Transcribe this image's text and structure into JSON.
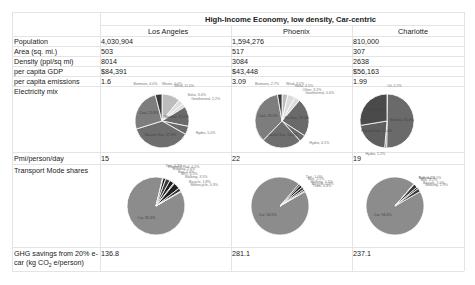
{
  "title": "High-Income Economy, low density, Car-centric",
  "cities": [
    "Los Angeles",
    "Phoenix",
    "Charlotte"
  ],
  "rows": [
    {
      "label": "Population",
      "values": [
        "4,030,904",
        "1,594,276",
        "810,000"
      ]
    },
    {
      "label": "Area (sq. mi.)",
      "values": [
        "503",
        "517",
        "307"
      ]
    },
    {
      "label": "Density (ppl/sq mi)",
      "values": [
        "8014",
        "3084",
        "2638"
      ]
    },
    {
      "label": "per capita GDP",
      "values": [
        "$84,391",
        "$43,448",
        "$56,163"
      ]
    },
    {
      "label": "per capita emissions",
      "values": [
        "1.6",
        "3.09",
        "1.99"
      ]
    }
  ],
  "electricity_label": "Electricity mix",
  "pmt_row": {
    "label": "Pmi/person/day",
    "values": [
      "15",
      "22",
      "19"
    ]
  },
  "transport_label": "Transport Mode shares",
  "ghg_row": {
    "label_line1": "GHG savings from 20% e-",
    "label_line2_pre": "car (kg CO",
    "label_line2_sub": "2",
    "label_line2_post": " e/person)",
    "values": [
      "136.8",
      "281.1",
      "237.1"
    ]
  },
  "chart_data": [
    {
      "type": "pie",
      "title": "Electricity mix - Los Angeles",
      "slices": [
        {
          "label": "Waste",
          "value": 0.0
        },
        {
          "label": "Wind",
          "value": 11.0
        },
        {
          "label": "Solar",
          "value": 3.0
        },
        {
          "label": "Geothermal",
          "value": 2.2
        },
        {
          "label": "Nuclear",
          "value": 12.0
        },
        {
          "label": "Hydro",
          "value": 5.0
        },
        {
          "label": "Natural Gas",
          "value": 37.0
        },
        {
          "label": "Coal",
          "value": 25.8
        },
        {
          "label": "Biomass",
          "value": 4.0
        }
      ]
    },
    {
      "type": "pie",
      "title": "Electricity mix - Phoenix",
      "slices": [
        {
          "label": "Wind",
          "value": 3.5
        },
        {
          "label": "Solar",
          "value": 4.5
        },
        {
          "label": "Other",
          "value": 3.2
        },
        {
          "label": "Geothermal",
          "value": 0.0
        },
        {
          "label": "Nuclear",
          "value": 23.0
        },
        {
          "label": "Hydro",
          "value": 4.1
        },
        {
          "label": "Natural Gas",
          "value": 24.0
        },
        {
          "label": "Coal",
          "value": 35.0
        },
        {
          "label": "Biomass",
          "value": 2.7
        }
      ]
    },
    {
      "type": "pie",
      "title": "Electricity mix - Charlotte",
      "slices": [
        {
          "label": "Oil",
          "value": 0.2
        },
        {
          "label": "Nuclear",
          "value": 50.0
        },
        {
          "label": "Hydro",
          "value": 1.2
        },
        {
          "label": "Natural Gas",
          "value": 21.0
        },
        {
          "label": "Coal",
          "value": 27.6
        }
      ]
    },
    {
      "type": "pie",
      "title": "Transport Mode shares - Los Angeles",
      "slices": [
        {
          "label": "Car",
          "value": 85.3
        },
        {
          "label": "Taxi",
          "value": 0.3
        },
        {
          "label": "Regional Rail",
          "value": 1.5
        },
        {
          "label": "Subway",
          "value": 2.4
        },
        {
          "label": "Bus",
          "value": 2.4
        },
        {
          "label": "BRT",
          "value": 0.5
        },
        {
          "label": "Walking",
          "value": 3.5
        },
        {
          "label": "Bicycle",
          "value": 1.8
        },
        {
          "label": "Motorcycle",
          "value": 0.3
        }
      ]
    },
    {
      "type": "pie",
      "title": "Transport Mode shares - Phoenix",
      "slices": [
        {
          "label": "Car",
          "value": 94.5
        },
        {
          "label": "Taxi",
          "value": 1.0
        },
        {
          "label": "Bus",
          "value": 1.5
        },
        {
          "label": "Walking",
          "value": 1.5
        },
        {
          "label": "Bicycle",
          "value": 0.9
        },
        {
          "label": "Tram",
          "value": 0.4
        }
      ]
    },
    {
      "type": "pie",
      "title": "Transport Mode shares - Charlotte",
      "slices": [
        {
          "label": "Car",
          "value": 94.6
        },
        {
          "label": "Subway",
          "value": 0.1
        },
        {
          "label": "Rail",
          "value": 0.2
        },
        {
          "label": "Bus",
          "value": 2.2
        },
        {
          "label": "Bicycle",
          "value": 1.0
        },
        {
          "label": "Walking",
          "value": 1.9
        }
      ]
    }
  ],
  "colors": {
    "car": "#8c8c8c",
    "dark": "#3a3a3a",
    "mid": "#6a6a6a",
    "light": "#bdbdbd",
    "pale": "#dcdcdc"
  }
}
